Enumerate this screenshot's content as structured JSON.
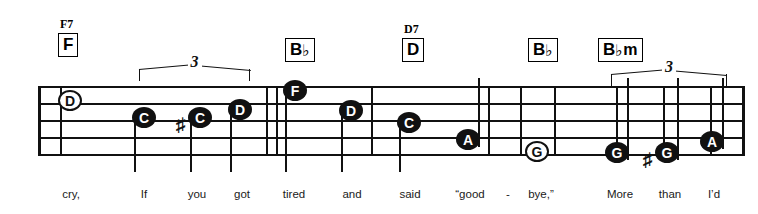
{
  "score": {
    "chords": [
      {
        "superscript": "F7",
        "box": "F",
        "flat": false,
        "quality": "",
        "sup_x": 60,
        "sup_y": 18,
        "box_x": 58,
        "box_y": 33
      },
      {
        "superscript": "",
        "box": "B",
        "flat": true,
        "quality": "",
        "sup_x": 0,
        "sup_y": 0,
        "box_x": 285,
        "box_y": 38
      },
      {
        "superscript": "D7",
        "box": "D",
        "flat": false,
        "quality": "",
        "sup_x": 404,
        "sup_y": 23,
        "box_x": 402,
        "box_y": 38
      },
      {
        "superscript": "",
        "box": "B",
        "flat": true,
        "quality": "",
        "sup_x": 0,
        "sup_y": 0,
        "box_x": 528,
        "box_y": 38
      },
      {
        "superscript": "",
        "box": "B",
        "flat": true,
        "quality": "m",
        "box_x": 598,
        "box_y": 38,
        "sup_x": 0,
        "sup_y": 0
      }
    ],
    "staff": {
      "line_count": 5,
      "left": 38,
      "top": 86,
      "width": 706,
      "height": 80,
      "line_spacing": 17
    },
    "barlines": [
      {
        "x": 0,
        "thick": true
      },
      {
        "x": 22,
        "thick": false
      },
      {
        "x": 228,
        "thick": false
      },
      {
        "x": 238,
        "thick": false
      },
      {
        "x": 333,
        "thick": false
      },
      {
        "x": 450,
        "thick": false
      },
      {
        "x": 482,
        "thick": false
      },
      {
        "x": 516,
        "thick": false
      },
      {
        "x": 578,
        "thick": false
      },
      {
        "x": 625,
        "thick": false
      },
      {
        "x": 672,
        "thick": false
      },
      {
        "x": 704,
        "thick": true
      }
    ],
    "notes": [
      {
        "letter": "D",
        "style": "hollow",
        "x": 70,
        "y": 100,
        "accidental": "",
        "stem": "none"
      },
      {
        "letter": "C",
        "style": "filled",
        "x": 144,
        "y": 117,
        "accidental": "",
        "stem": "down"
      },
      {
        "letter": "C",
        "style": "filled",
        "x": 200,
        "y": 117,
        "accidental": "#",
        "stem": "down"
      },
      {
        "letter": "D",
        "style": "filled",
        "x": 240,
        "y": 109,
        "accidental": "",
        "stem": "down"
      },
      {
        "letter": "F",
        "style": "filled",
        "x": 295,
        "y": 90,
        "accidental": "",
        "stem": "down"
      },
      {
        "letter": "D",
        "style": "filled",
        "x": 351,
        "y": 110,
        "accidental": "",
        "stem": "down"
      },
      {
        "letter": "C",
        "style": "filled",
        "x": 409,
        "y": 122,
        "accidental": "",
        "stem": "down"
      },
      {
        "letter": "A",
        "style": "filled",
        "x": 468,
        "y": 139,
        "accidental": "",
        "stem": "up"
      },
      {
        "letter": "G",
        "style": "hollow",
        "x": 537,
        "y": 151,
        "accidental": "",
        "stem": "none"
      },
      {
        "letter": "G",
        "style": "filled",
        "x": 617,
        "y": 152,
        "accidental": "",
        "stem": "up"
      },
      {
        "letter": "G",
        "style": "filled",
        "x": 667,
        "y": 152,
        "accidental": "#",
        "stem": "up"
      },
      {
        "letter": "A",
        "style": "filled",
        "x": 712,
        "y": 141,
        "accidental": "",
        "stem": "up"
      }
    ],
    "triplets": [
      {
        "number": "3",
        "left": 139,
        "right": 250,
        "top": 57
      },
      {
        "number": "3",
        "left": 611,
        "right": 727,
        "top": 62
      }
    ],
    "lyrics": [
      {
        "text": "cry,",
        "x": 71
      },
      {
        "text": "If",
        "x": 144
      },
      {
        "text": "you",
        "x": 197
      },
      {
        "text": "got",
        "x": 242
      },
      {
        "text": "tired",
        "x": 294
      },
      {
        "text": "and",
        "x": 352
      },
      {
        "text": "said",
        "x": 410
      },
      {
        "text": "“good",
        "x": 470
      },
      {
        "text": "-",
        "x": 508
      },
      {
        "text": "bye,”",
        "x": 541
      },
      {
        "text": "More",
        "x": 620
      },
      {
        "text": "than",
        "x": 670
      },
      {
        "text": "I’d",
        "x": 714
      }
    ],
    "lyric_baseline_y": 189
  }
}
